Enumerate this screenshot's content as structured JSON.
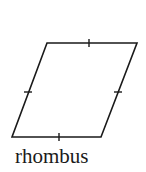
{
  "figure": {
    "shape": "rhombus",
    "label": "rhombus",
    "stroke_color": "#1a1a1a",
    "vertices": [
      [
        47,
        43
      ],
      [
        137,
        43
      ],
      [
        101,
        137
      ],
      [
        12,
        137
      ]
    ],
    "tick_marks": [
      {
        "side": "top",
        "at": [
          89,
          43
        ]
      },
      {
        "side": "right",
        "at": [
          118,
          92
        ]
      },
      {
        "side": "bottom",
        "at": [
          59,
          137
        ]
      },
      {
        "side": "left",
        "at": [
          28,
          92
        ]
      }
    ]
  }
}
